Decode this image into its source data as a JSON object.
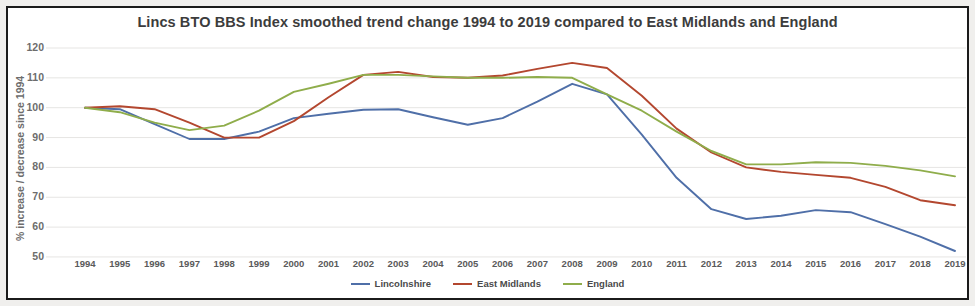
{
  "chart_data": {
    "type": "line",
    "title": "Lincs BTO BBS Index smoothed trend change 1994 to 2019 compared to East Midlands and England",
    "xlabel": "",
    "ylabel": "% increase / decrease since 1994",
    "ylim": [
      50,
      120
    ],
    "ytick_labels": [
      "120",
      "110",
      "100",
      "90",
      "80",
      "70",
      "60",
      "50"
    ],
    "yticks": [
      120,
      110,
      100,
      90,
      80,
      70,
      60,
      50
    ],
    "grid": true,
    "legend_position": "bottom-center",
    "categories": [
      "1994",
      "1995",
      "1996",
      "1997",
      "1998",
      "1999",
      "2000",
      "2001",
      "2002",
      "2003",
      "2004",
      "2005",
      "2006",
      "2007",
      "2008",
      "2009",
      "2010",
      "2011",
      "2012",
      "2013",
      "2014",
      "2015",
      "2016",
      "2017",
      "2018",
      "2019"
    ],
    "series": [
      {
        "name": "Lincolnshire",
        "color": "#4f6fa8",
        "values": [
          100,
          99.5,
          94.5,
          89.5,
          89.5,
          92,
          96.5,
          98,
          99.3,
          99.5,
          96.8,
          94.3,
          96.5,
          102,
          108,
          104.5,
          91,
          76.5,
          66,
          62.7,
          63.8,
          65.7,
          65,
          61,
          56.8,
          52
        ]
      },
      {
        "name": "East Midlands",
        "color": "#b3472f",
        "values": [
          100,
          100.5,
          99.5,
          95,
          90,
          90,
          95.5,
          103.5,
          111,
          112,
          110.3,
          110,
          110.8,
          113,
          115,
          113.3,
          104,
          93,
          85,
          80,
          78.5,
          77.5,
          76.5,
          73.5,
          69,
          67.3
        ]
      },
      {
        "name": "England",
        "color": "#8fad4b",
        "values": [
          100,
          98.5,
          95,
          92.5,
          94,
          99,
          105.3,
          108,
          111,
          111,
          110.5,
          110,
          110,
          110.3,
          110,
          104.5,
          99,
          92,
          85.5,
          81,
          81,
          81.7,
          81.5,
          80.5,
          79,
          77
        ]
      }
    ]
  },
  "legend": {
    "items": [
      {
        "label": "Lincolnshire",
        "color": "#4f6fa8"
      },
      {
        "label": "East Midlands",
        "color": "#b3472f"
      },
      {
        "label": "England",
        "color": "#8fad4b"
      }
    ]
  }
}
